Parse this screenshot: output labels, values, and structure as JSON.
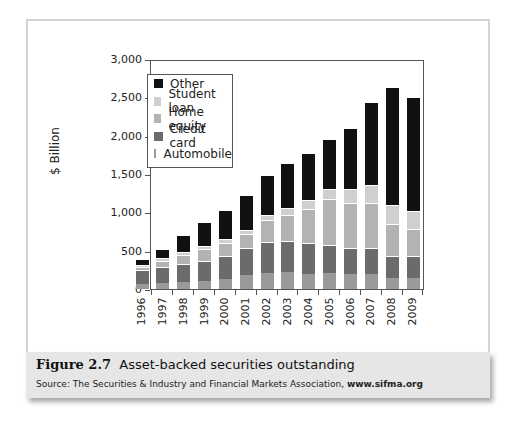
{
  "figure": {
    "number": "Figure 2.7",
    "title": "Asset-backed securities outstanding",
    "source_prefix": "Source: The Securities & Industry and Financial Markets Association, ",
    "source_url": "www.sifma.org"
  },
  "colors": {
    "Other": "#111111",
    "Student loan": "#cfcfcf",
    "Home equity": "#b3b3b3",
    "Credit card": "#6b6b6b",
    "Automobile": "#9a9a9a"
  },
  "chart_data": {
    "type": "bar",
    "stacked": true,
    "title": "",
    "xlabel": "",
    "ylabel": "$ Billion",
    "ylim": [
      0,
      3000
    ],
    "yticks": [
      0,
      500,
      1000,
      1500,
      2000,
      2500,
      3000
    ],
    "ytick_labels": [
      "0",
      "500",
      "1,000",
      "1,500",
      "2,000",
      "2,500",
      "3,000"
    ],
    "grid": false,
    "legend_position": "upper left (inside)",
    "legend": [
      "Other",
      "Student loan",
      "Home equity",
      "Credit card",
      "Automobile"
    ],
    "categories": [
      "1996",
      "1997",
      "1998",
      "1999",
      "2000",
      "2001",
      "2002",
      "2003",
      "2004",
      "2005",
      "2006",
      "2007",
      "2008",
      "2009"
    ],
    "series": [
      {
        "name": "Automobile",
        "values": [
          70,
          80,
          90,
          100,
          130,
          180,
          210,
          220,
          200,
          210,
          200,
          190,
          140,
          140
        ]
      },
      {
        "name": "Credit card",
        "values": [
          180,
          210,
          230,
          260,
          300,
          350,
          400,
          400,
          400,
          360,
          330,
          340,
          290,
          290
        ]
      },
      {
        "name": "Home equity",
        "values": [
          40,
          80,
          120,
          160,
          170,
          190,
          290,
          350,
          450,
          610,
          590,
          590,
          420,
          350
        ]
      },
      {
        "name": "Student loan",
        "values": [
          20,
          30,
          40,
          40,
          50,
          50,
          60,
          90,
          110,
          130,
          180,
          240,
          240,
          240
        ]
      },
      {
        "name": "Other",
        "values": [
          80,
          120,
          230,
          310,
          380,
          460,
          530,
          590,
          620,
          650,
          800,
          1080,
          1550,
          1480
        ]
      }
    ]
  }
}
